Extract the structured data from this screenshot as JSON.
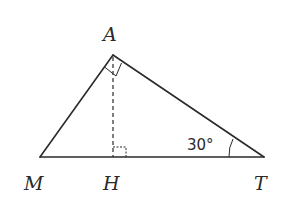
{
  "diagram": {
    "type": "right-triangle-with-altitude",
    "vertices": {
      "A": {
        "label": "A",
        "x": 113,
        "y": 55
      },
      "M": {
        "label": "M",
        "x": 40,
        "y": 157
      },
      "H": {
        "label": "H",
        "x": 113,
        "y": 157
      },
      "T": {
        "label": "T",
        "x": 264,
        "y": 157
      }
    },
    "segments": [
      {
        "from": "A",
        "to": "M",
        "style": "solid"
      },
      {
        "from": "A",
        "to": "T",
        "style": "solid"
      },
      {
        "from": "M",
        "to": "T",
        "style": "solid"
      },
      {
        "from": "A",
        "to": "H",
        "style": "dashed"
      }
    ],
    "right_angles": [
      "A",
      "H"
    ],
    "angle_T": {
      "label": "30°",
      "value_deg": 30
    }
  },
  "labels": {
    "A": "A",
    "M": "M",
    "H": "H",
    "T": "T",
    "angle_T": "30°"
  }
}
